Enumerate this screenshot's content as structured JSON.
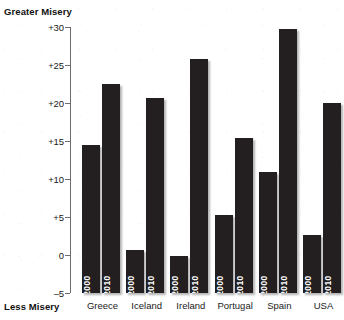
{
  "chart_data": {
    "type": "bar",
    "title": "",
    "top_axis_label": "Greater Misery",
    "bottom_axis_label": "Less Misery",
    "xlabel": "",
    "ylabel": "",
    "categories": [
      "Greece",
      "Iceland",
      "Ireland",
      "Portugal",
      "Spain",
      "USA"
    ],
    "series": [
      {
        "name": "2000",
        "values": [
          14.5,
          0.7,
          -0.1,
          5.3,
          10.9,
          2.6
        ]
      },
      {
        "name": "2010",
        "values": [
          22.5,
          20.7,
          25.8,
          15.4,
          29.7,
          20.0
        ]
      }
    ],
    "ylim": [
      -5,
      30
    ],
    "yticks": [
      30,
      25,
      20,
      15,
      10,
      5,
      0,
      -5
    ],
    "ytick_labels": [
      "+30",
      "+25",
      "+20",
      "+15",
      "+10",
      "+5",
      "0",
      "–5"
    ],
    "grid": false,
    "legend": "none",
    "bar_color": "#231f20",
    "in_bar_labels": [
      "2000",
      "2010"
    ]
  }
}
